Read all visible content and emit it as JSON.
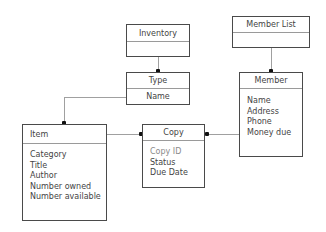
{
  "diagram": {
    "type": "uml-class-diagram",
    "classes": [
      {
        "id": "inventory",
        "name": "Inventory",
        "attributes": []
      },
      {
        "id": "member_list",
        "name": "Member List",
        "attributes": []
      },
      {
        "id": "type",
        "name": "Type",
        "attributes": [
          "Name"
        ]
      },
      {
        "id": "member",
        "name": "Member",
        "attributes": [
          "Name",
          "Address",
          "Phone",
          "Money due"
        ]
      },
      {
        "id": "item",
        "name": "Item",
        "attributes": [
          "Category",
          "Title",
          "Author",
          "Number owned",
          "Number available"
        ]
      },
      {
        "id": "copy",
        "name": "Copy",
        "attributes": [
          "Copy ID",
          "Status",
          "Due Date"
        ]
      }
    ],
    "relationships": [
      {
        "from": "Inventory",
        "to": "Type",
        "end_marker": "filled-dot-at-Type"
      },
      {
        "from": "Member List",
        "to": "Member",
        "end_marker": "filled-dot-at-Member"
      },
      {
        "from": "Type",
        "to": "Item",
        "end_marker": "filled-dot-at-Item"
      },
      {
        "from": "Item",
        "to": "Copy",
        "end_marker": "filled-dot-at-Copy"
      },
      {
        "from": "Member",
        "to": "Copy",
        "end_marker": "filled-dot-at-Copy"
      }
    ],
    "colors": {
      "border": "#4a4a4a",
      "connector": "#a0a0a0",
      "dot": "#111111",
      "text": "#444444",
      "muted_text": "#8a8a8a"
    }
  }
}
